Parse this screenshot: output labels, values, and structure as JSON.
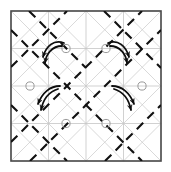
{
  "figure": {
    "title": "Origami crease pattern with twist-fold rotation arrows",
    "caption": "",
    "width": 171,
    "height": 172,
    "background_color": "#ffffff"
  },
  "colors": {
    "border": "#4a4a4a",
    "grid_line": "#bdbdbd",
    "diagonal_line": "#c9c9c9",
    "dashed_fold": "#111111",
    "arrow": "#0d0d0d",
    "vertex_circle": "#9a9a9a"
  },
  "border": {
    "name": "paper-edge",
    "x": 11,
    "y": 11,
    "width": 150,
    "height": 150,
    "stroke_width": 1.6
  },
  "grid": {
    "horizontal_y": [
      11,
      48.5,
      86,
      123.5,
      161
    ],
    "vertical_x": [
      11,
      48.5,
      86,
      123.5,
      161
    ],
    "stroke_width": 0.7,
    "visible": true
  },
  "diagonals": {
    "stroke_width": 0.7,
    "segments": [
      {
        "x1": 11,
        "y1": 11,
        "x2": 48.5,
        "y2": 48.5
      },
      {
        "x1": 48.5,
        "y1": 11,
        "x2": 11,
        "y2": 48.5
      },
      {
        "x1": 48.5,
        "y1": 11,
        "x2": 86,
        "y2": 48.5
      },
      {
        "x1": 86,
        "y1": 11,
        "x2": 48.5,
        "y2": 48.5
      },
      {
        "x1": 86,
        "y1": 11,
        "x2": 123.5,
        "y2": 48.5
      },
      {
        "x1": 123.5,
        "y1": 11,
        "x2": 86,
        "y2": 48.5
      },
      {
        "x1": 123.5,
        "y1": 11,
        "x2": 161,
        "y2": 48.5
      },
      {
        "x1": 161,
        "y1": 11,
        "x2": 123.5,
        "y2": 48.5
      },
      {
        "x1": 11,
        "y1": 48.5,
        "x2": 48.5,
        "y2": 86
      },
      {
        "x1": 48.5,
        "y1": 48.5,
        "x2": 11,
        "y2": 86
      },
      {
        "x1": 48.5,
        "y1": 48.5,
        "x2": 86,
        "y2": 86
      },
      {
        "x1": 86,
        "y1": 48.5,
        "x2": 48.5,
        "y2": 86
      },
      {
        "x1": 86,
        "y1": 48.5,
        "x2": 123.5,
        "y2": 86
      },
      {
        "x1": 123.5,
        "y1": 48.5,
        "x2": 86,
        "y2": 86
      },
      {
        "x1": 123.5,
        "y1": 48.5,
        "x2": 161,
        "y2": 86
      },
      {
        "x1": 161,
        "y1": 48.5,
        "x2": 123.5,
        "y2": 86
      },
      {
        "x1": 11,
        "y1": 86,
        "x2": 48.5,
        "y2": 123.5
      },
      {
        "x1": 48.5,
        "y1": 86,
        "x2": 11,
        "y2": 123.5
      },
      {
        "x1": 48.5,
        "y1": 86,
        "x2": 86,
        "y2": 123.5
      },
      {
        "x1": 86,
        "y1": 86,
        "x2": 48.5,
        "y2": 123.5
      },
      {
        "x1": 86,
        "y1": 86,
        "x2": 123.5,
        "y2": 123.5
      },
      {
        "x1": 123.5,
        "y1": 86,
        "x2": 86,
        "y2": 123.5
      },
      {
        "x1": 123.5,
        "y1": 86,
        "x2": 161,
        "y2": 123.5
      },
      {
        "x1": 161,
        "y1": 86,
        "x2": 123.5,
        "y2": 123.5
      },
      {
        "x1": 11,
        "y1": 123.5,
        "x2": 48.5,
        "y2": 161
      },
      {
        "x1": 48.5,
        "y1": 123.5,
        "x2": 11,
        "y2": 161
      },
      {
        "x1": 48.5,
        "y1": 123.5,
        "x2": 86,
        "y2": 161
      },
      {
        "x1": 86,
        "y1": 123.5,
        "x2": 48.5,
        "y2": 161
      },
      {
        "x1": 86,
        "y1": 123.5,
        "x2": 123.5,
        "y2": 161
      },
      {
        "x1": 123.5,
        "y1": 123.5,
        "x2": 86,
        "y2": 161
      },
      {
        "x1": 123.5,
        "y1": 123.5,
        "x2": 161,
        "y2": 161
      },
      {
        "x1": 161,
        "y1": 123.5,
        "x2": 123.5,
        "y2": 161
      }
    ]
  },
  "dashed_folds": {
    "stroke_width": 2.1,
    "dash_pattern": "9 6",
    "segments": [
      {
        "label": "fold-ne-1",
        "x1": 11,
        "y1": 67,
        "x2": 67,
        "y2": 11
      },
      {
        "label": "fold-ne-2",
        "x1": 11,
        "y1": 142,
        "x2": 142,
        "y2": 11
      },
      {
        "label": "fold-ne-3",
        "x1": 30,
        "y1": 161,
        "x2": 161,
        "y2": 30
      },
      {
        "label": "fold-ne-4",
        "x1": 105,
        "y1": 161,
        "x2": 161,
        "y2": 105
      },
      {
        "label": "fold-nw-1",
        "x1": 104,
        "y1": 11,
        "x2": 161,
        "y2": 68
      },
      {
        "label": "fold-nw-2",
        "x1": 11,
        "y1": 30,
        "x2": 142,
        "y2": 161
      },
      {
        "label": "fold-nw-3",
        "x1": 11,
        "y1": 105,
        "x2": 67,
        "y2": 161
      },
      {
        "label": "fold-nw-4",
        "x1": 29,
        "y1": 11,
        "x2": 86,
        "y2": 68
      }
    ]
  },
  "vertices": [
    {
      "label": "twist-vertex-top-left",
      "cx": 66,
      "cy": 48.5,
      "r": 4.1
    },
    {
      "label": "twist-vertex-top-right",
      "cx": 106,
      "cy": 48.5,
      "r": 4.1
    },
    {
      "label": "twist-vertex-mid-left",
      "cx": 30,
      "cy": 86,
      "r": 4.1
    },
    {
      "label": "twist-vertex-mid-right",
      "cx": 142,
      "cy": 86,
      "r": 4.1
    },
    {
      "label": "twist-vertex-bottom-left",
      "cx": 66,
      "cy": 123.5,
      "r": 4.1
    },
    {
      "label": "twist-vertex-bottom-right",
      "cx": 106,
      "cy": 123.5,
      "r": 4.1
    }
  ],
  "arrows": {
    "stroke_width": 1.8,
    "head_size": 5.5,
    "groups": [
      {
        "label": "rotation-arrow-top-left",
        "direction": "counterclockwise",
        "strokes": [
          {
            "path": "M 64 43 C 54 39 46 46 43 57",
            "head_angle": 110
          },
          {
            "path": "M 62 46 C 52 46 46 54 45 63",
            "head_angle": 100
          }
        ]
      },
      {
        "label": "rotation-arrow-top-right",
        "direction": "clockwise",
        "strokes": [
          {
            "path": "M 108 43 C 118 39 126 46 129 57",
            "head_angle": 70
          },
          {
            "path": "M 110 46 C 120 46 126 54 127 63",
            "head_angle": 80
          }
        ]
      },
      {
        "label": "rotation-arrow-mid-left",
        "direction": "counterclockwise",
        "strokes": [
          {
            "path": "M 60 86 C 50 86 42 93 38 104",
            "head_angle": 110
          },
          {
            "path": "M 58 89 C 48 92 43 100 41 110",
            "head_angle": 100
          }
        ]
      },
      {
        "label": "rotation-arrow-mid-right",
        "direction": "clockwise",
        "strokes": [
          {
            "path": "M 112 86 C 122 86 130 93 134 104",
            "head_angle": 70
          },
          {
            "path": "M 114 89 C 124 92 129 100 131 110",
            "head_angle": 80
          }
        ]
      }
    ]
  },
  "legend": {
    "visible": false,
    "items": []
  }
}
